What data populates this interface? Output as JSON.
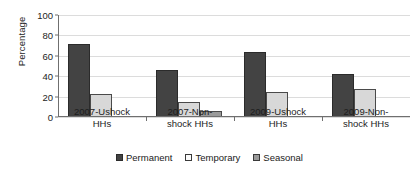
{
  "chart_data": {
    "type": "bar",
    "title": "",
    "subtitle": "",
    "xlabel": "",
    "ylabel": "Percentage",
    "ylim": [
      0,
      100
    ],
    "yticks": [
      0,
      20,
      40,
      60,
      80,
      100
    ],
    "ytick_labels": [
      "0",
      "20",
      "40",
      "60",
      "80",
      "100"
    ],
    "grid": true,
    "legend_position": "bottom",
    "categories": [
      "2007-Ushock HHs",
      "2007-Non-shock HHs",
      "2009-Ushock HHs",
      "2009-Non-shock HHs"
    ],
    "category_lines": [
      [
        "2007-Ushock",
        "HHs"
      ],
      [
        "2007-Non-",
        "shock HHs"
      ],
      [
        "2009-Ushock",
        "HHs"
      ],
      [
        "2009-Non-",
        "shock HHs"
      ]
    ],
    "series": [
      {
        "name": "Permanent",
        "color": "#434343",
        "values": [
          72,
          46,
          64,
          42
        ]
      },
      {
        "name": "Temporary",
        "color": "#d8d8d8",
        "values": [
          23,
          15,
          25,
          27
        ]
      },
      {
        "name": "Seasonal",
        "color": "#9a9a9a",
        "values": [
          1,
          6,
          0,
          0
        ]
      }
    ]
  },
  "legend": {
    "items": [
      {
        "label": "Permanent",
        "swatch": "permanent"
      },
      {
        "label": "Temporary",
        "swatch": "temporary"
      },
      {
        "label": "Seasonal",
        "swatch": "seasonal"
      }
    ]
  }
}
